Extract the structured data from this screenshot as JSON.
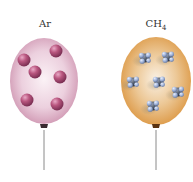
{
  "diagram": {
    "balloons": [
      {
        "id": "ar",
        "label": "Ar",
        "gas": "argon",
        "color": "#d9a6c0",
        "particle_count": 6,
        "particle_type": "single atom",
        "particle_color": "#a84a78"
      },
      {
        "id": "ch4",
        "label_main": "CH",
        "label_sub": "4",
        "gas": "methane",
        "color": "#e3a85a",
        "particle_count": 6,
        "particle_type": "molecule",
        "particle_color": "#7d92b8"
      }
    ]
  }
}
